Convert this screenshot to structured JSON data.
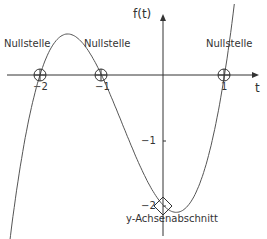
{
  "chart_data": {
    "type": "line",
    "title": "",
    "xlabel": "t",
    "ylabel": "f(t)",
    "function": "f(t) = (t+2)(t+1)(t-1)",
    "xlim": [
      -2.6,
      1.7
    ],
    "ylim": [
      -2.5,
      1.1
    ],
    "x_ticks": [
      {
        "value": -2,
        "label": "−2"
      },
      {
        "value": -1,
        "label": "−1"
      },
      {
        "value": 1,
        "label": "1"
      }
    ],
    "y_ticks": [
      {
        "value": -1,
        "label": "−1"
      },
      {
        "value": -2,
        "label": "−2"
      }
    ],
    "grid": false,
    "series": [
      {
        "name": "f(t)",
        "x": [
          -2.6,
          -2.4,
          -2.2,
          -2.0,
          -1.8,
          -1.6,
          -1.4,
          -1.2,
          -1.0,
          -0.8,
          -0.6,
          -0.4,
          -0.2,
          0.0,
          0.2,
          0.4,
          0.6,
          0.8,
          1.0,
          1.2,
          1.4,
          1.5
        ],
        "y": [
          -1.5,
          -0.66,
          -0.14,
          0.0,
          0.18,
          0.62,
          0.62,
          0.44,
          0.0,
          -0.36,
          -0.92,
          -1.37,
          -1.74,
          -2.0,
          -2.11,
          -2.05,
          -1.78,
          -1.26,
          0.0,
          0.89,
          2.28,
          3.12
        ]
      }
    ],
    "annotations": [
      {
        "label": "Nullstelle",
        "x": -2,
        "y": 0,
        "marker": "circle"
      },
      {
        "label": "Nullstelle",
        "x": -1,
        "y": 0,
        "marker": "circle"
      },
      {
        "label": "Nullstelle",
        "x": 1,
        "y": 0,
        "marker": "circle"
      },
      {
        "label": "y-Achsenabschnitt",
        "x": 0,
        "y": -2,
        "marker": "diamond"
      }
    ]
  },
  "labels": {
    "x_axis": "t",
    "y_axis": "f(t)",
    "root_label": "Nullstelle",
    "intercept_label": "y-Achsenabschnitt",
    "tick_x_m2": "−2",
    "tick_x_m1": "−1",
    "tick_x_1": "1",
    "tick_y_m1": "−1",
    "tick_y_m2": "−2"
  },
  "colors": {
    "curve": "#555555",
    "axis": "#333333"
  }
}
